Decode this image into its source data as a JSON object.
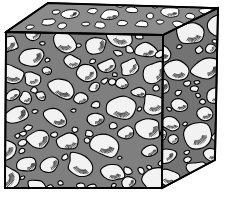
{
  "figure": {
    "type": "isometric-cube-diagram",
    "background_color": "#ffffff",
    "outline_color": "#000000",
    "title": "",
    "caption": ""
  },
  "colors": {
    "background": "#ffffff",
    "matrix_top": "#8c8c8c",
    "matrix_front": "#7f7f7f",
    "matrix_right": "#737373",
    "aggregate_fill": "#f2f2f2",
    "aggregate_fill_top": "#ffffff",
    "outline": "#000000",
    "hatch": "#1a1a1a"
  },
  "geometry": {
    "cube_vertices": {
      "top_left": [
        6,
        32
      ],
      "top_back_left": [
        48,
        3
      ],
      "top_back_right": [
        218,
        8
      ],
      "top_right_front": [
        163,
        35
      ],
      "front_bottom_left": [
        5,
        188
      ],
      "front_bottom_right": [
        162,
        188
      ],
      "right_bottom": [
        215,
        160
      ]
    },
    "faces": [
      "top",
      "front",
      "right"
    ]
  },
  "faces": {
    "top": {
      "name": "top-face",
      "label": "top face",
      "matrix_color": "#8c8c8c",
      "aggregate_count": 22
    },
    "front": {
      "name": "front-face",
      "label": "front face",
      "matrix_color": "#7f7f7f",
      "aggregate_count": 58
    },
    "right": {
      "name": "right-face",
      "label": "right face",
      "matrix_color": "#737373",
      "aggregate_count": 34
    }
  },
  "top_aggregates": [
    {
      "cx": 70,
      "cy": 14,
      "rx": 9,
      "ry": 4,
      "rot": -8,
      "hatch": true
    },
    {
      "cx": 93,
      "cy": 11,
      "rx": 5,
      "ry": 3,
      "rot": -6,
      "hatch": false
    },
    {
      "cx": 110,
      "cy": 15,
      "rx": 10,
      "ry": 5,
      "rot": -4,
      "hatch": true
    },
    {
      "cx": 132,
      "cy": 10,
      "rx": 6,
      "ry": 3,
      "rot": -3,
      "hatch": false
    },
    {
      "cx": 150,
      "cy": 16,
      "rx": 4,
      "ry": 3,
      "rot": 0,
      "hatch": false
    },
    {
      "cx": 170,
      "cy": 12,
      "rx": 10,
      "ry": 5,
      "rot": 2,
      "hatch": true
    },
    {
      "cx": 190,
      "cy": 16,
      "rx": 5,
      "ry": 3,
      "rot": 3,
      "hatch": false
    },
    {
      "cx": 205,
      "cy": 11,
      "rx": 7,
      "ry": 3,
      "rot": 2,
      "hatch": false
    },
    {
      "cx": 48,
      "cy": 22,
      "rx": 7,
      "ry": 3,
      "rot": -10,
      "hatch": false
    },
    {
      "cx": 62,
      "cy": 26,
      "rx": 5,
      "ry": 3,
      "rot": -8,
      "hatch": false
    },
    {
      "cx": 86,
      "cy": 24,
      "rx": 4,
      "ry": 2,
      "rot": -5,
      "hatch": false
    },
    {
      "cx": 100,
      "cy": 25,
      "rx": 6,
      "ry": 3,
      "rot": -4,
      "hatch": false
    },
    {
      "cx": 122,
      "cy": 23,
      "rx": 5,
      "ry": 3,
      "rot": -2,
      "hatch": false
    },
    {
      "cx": 142,
      "cy": 24,
      "rx": 7,
      "ry": 3,
      "rot": 0,
      "hatch": false
    },
    {
      "cx": 160,
      "cy": 22,
      "rx": 4,
      "ry": 2,
      "rot": 2,
      "hatch": false
    },
    {
      "cx": 178,
      "cy": 24,
      "rx": 6,
      "ry": 3,
      "rot": 3,
      "hatch": false
    },
    {
      "cx": 198,
      "cy": 25,
      "rx": 5,
      "ry": 3,
      "rot": 3,
      "hatch": false
    },
    {
      "cx": 30,
      "cy": 27,
      "rx": 4,
      "ry": 2,
      "rot": -12,
      "hatch": false
    },
    {
      "cx": 56,
      "cy": 12,
      "rx": 4,
      "ry": 2,
      "rot": -9,
      "hatch": false
    },
    {
      "cx": 212,
      "cy": 20,
      "rx": 4,
      "ry": 2,
      "rot": 3,
      "hatch": false
    },
    {
      "cx": 120,
      "cy": 5,
      "rx": 5,
      "ry": 2,
      "rot": -2,
      "hatch": false
    },
    {
      "cx": 155,
      "cy": 6,
      "rx": 4,
      "ry": 2,
      "rot": 0,
      "hatch": false
    }
  ],
  "accessibility": {
    "alt_text": "Three-dimensional cube illustration showing concrete composite microstructure: rounded white aggregate particles embedded in a gray cement matrix, visible on the top, front and right faces."
  }
}
